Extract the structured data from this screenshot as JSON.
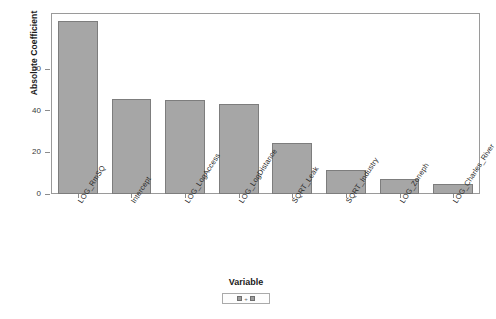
{
  "chart_data": {
    "type": "bar",
    "title": "",
    "xlabel": "Variable",
    "ylabel": "Absolute Coefficient",
    "ylim": [
      0,
      87
    ],
    "yticks": [
      0,
      20,
      40,
      60
    ],
    "grid": false,
    "legend_position": "bottom",
    "legend_title": "Variable",
    "categories": [
      "LOG_RmSQ",
      "Intercept",
      "LOG_LogAccess",
      "LOG_LogDistance",
      "SQRT_Leak",
      "SQRT_Industry",
      "LOG_Zoneph",
      "LOG_Charles_River"
    ],
    "values": [
      83,
      45.5,
      45,
      43.5,
      24.5,
      11.5,
      7,
      5
    ],
    "bar_color": "#a6a6a6",
    "bar_edge_color": "#7d7d7d"
  },
  "legend": {
    "swatch_separator": "+"
  }
}
